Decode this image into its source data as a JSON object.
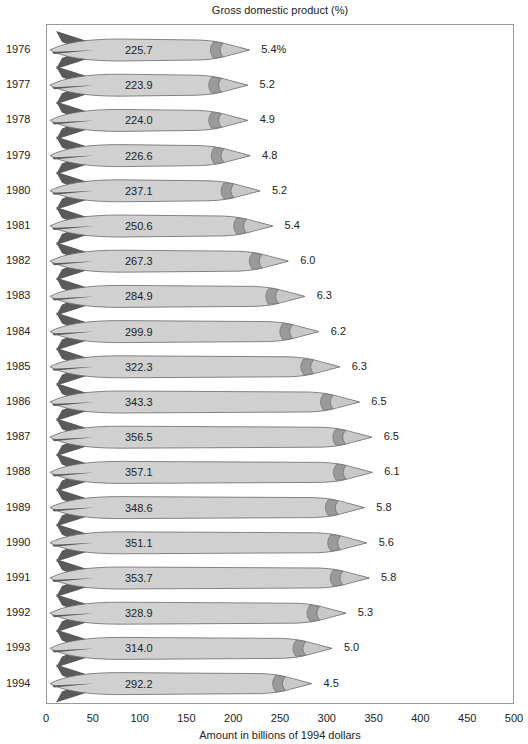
{
  "chart_data": {
    "type": "bar",
    "title": "Gross domestic product (%)",
    "xlabel": "Amount in billions of 1994 dollars",
    "ylabel": "",
    "xlim": [
      0,
      500
    ],
    "x_ticks": [
      "0",
      "50",
      "100",
      "150",
      "200",
      "250",
      "300",
      "350",
      "400",
      "450",
      "500"
    ],
    "grid": false,
    "orientation": "horizontal",
    "categories": [
      "1976",
      "1977",
      "1978",
      "1979",
      "1980",
      "1981",
      "1982",
      "1983",
      "1984",
      "1985",
      "1986",
      "1987",
      "1988",
      "1989",
      "1990",
      "1991",
      "1992",
      "1993",
      "1994"
    ],
    "series": [
      {
        "name": "Amount (billions of 1994 dollars)",
        "values": [
          225.7,
          223.9,
          224.0,
          226.6,
          237.1,
          250.6,
          267.3,
          284.9,
          299.9,
          322.3,
          343.3,
          356.5,
          357.1,
          348.6,
          351.1,
          353.7,
          328.9,
          314.0,
          292.2
        ]
      },
      {
        "name": "Percent of GDP",
        "values": [
          5.4,
          5.2,
          4.9,
          4.8,
          5.2,
          5.4,
          6.0,
          6.3,
          6.2,
          6.3,
          6.5,
          6.5,
          6.1,
          5.8,
          5.6,
          5.8,
          5.3,
          5.0,
          4.5
        ]
      }
    ],
    "value_labels": [
      "225.7",
      "223.9",
      "224.0",
      "226.6",
      "237.1",
      "250.6",
      "267.3",
      "284.9",
      "299.9",
      "322.3",
      "343.3",
      "356.5",
      "357.1",
      "348.6",
      "351.1",
      "353.7",
      "328.9",
      "314.0",
      "292.2"
    ],
    "pct_labels": [
      "5.4%",
      "5.2",
      "4.9",
      "4.8",
      "5.2",
      "5.4",
      "6.0",
      "6.3",
      "6.2",
      "6.3",
      "6.5",
      "6.5",
      "6.1",
      "5.8",
      "5.6",
      "5.8",
      "5.3",
      "5.0",
      "4.5"
    ],
    "colors": {
      "body": "#d0d0d0",
      "fin": "#5a5a5a",
      "band": "#9a9a9a",
      "nose": "#c8c8c8",
      "outline": "#6a6a6a"
    }
  }
}
